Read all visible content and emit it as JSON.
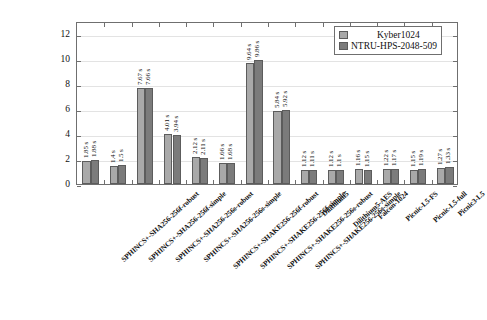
{
  "chart_data": {
    "type": "bar",
    "title": "",
    "xlabel": "",
    "ylabel": "",
    "ylim": [
      0,
      13
    ],
    "yticks": [
      0,
      2,
      4,
      6,
      8,
      10,
      12
    ],
    "grid": true,
    "legend_position": "top-right",
    "unit_suffix": " s",
    "categories": [
      "SPHINCS+-SHA256-256f-robust",
      "SPHINCS+-SHA256-256f-simple",
      "SPHINCS+-SHA256-256s-robust",
      "SPHINCS+-SHA256-256s-simple",
      "SPHINCS+-SHAKE256-256f-robust",
      "SPHINCS+-SHAKE256-256f-simple",
      "SPHINCS+-SHAKE256-256s-robust",
      "SPHINCS+-SHAKE256-256s-simple",
      "Dilithium5",
      "Dilithium5-AES",
      "Falcon-1024",
      "Picnic-L5-FS",
      "Picnic-L5-full",
      "Picnic3-L5"
    ],
    "series": [
      {
        "name": "Kyber1024",
        "color": "#a9a9a9",
        "values": [
          1.85,
          1.4,
          7.67,
          4.01,
          2.12,
          1.66,
          9.64,
          5.84,
          1.12,
          1.12,
          1.16,
          1.22,
          1.15,
          1.27
        ],
        "labels": [
          "1.85 s",
          "1.4 s",
          "7.67 s",
          "4.01 s",
          "2.12 s",
          "1.66 s",
          "9.64 s",
          "5.84 s",
          "1.12 s",
          "1.12 s",
          "1.16 s",
          "1.22 s",
          "1.15 s",
          "1.27 s"
        ]
      },
      {
        "name": "NTRU-HPS-2048-509",
        "color": "#7b7b7b",
        "values": [
          1.88,
          1.5,
          7.66,
          3.94,
          2.11,
          1.68,
          9.86,
          5.92,
          1.11,
          1.1,
          1.15,
          1.17,
          1.19,
          1.33
        ],
        "labels": [
          "1.88 s",
          "1.5 s",
          "7.66 s",
          "3.94 s",
          "2.11 s",
          "1.68 s",
          "9.86 s",
          "5.92 s",
          "1.11 s",
          "1.1 s",
          "1.15 s",
          "1.17 s",
          "1.19 s",
          "1.33 s"
        ]
      }
    ]
  },
  "legend": {
    "entries": [
      {
        "label": "Kyber1024"
      },
      {
        "label": "NTRU-HPS-2048-509"
      }
    ]
  }
}
